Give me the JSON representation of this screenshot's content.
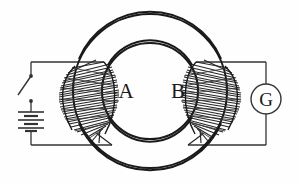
{
  "diagram": {
    "background_color": "#fefefe",
    "ink_color": "#1a1a1a",
    "coil_color": "#262626"
  },
  "labels": {
    "core_left": "A",
    "core_right": "B",
    "meter": "G"
  },
  "components": {
    "ring": {
      "name": "iron-ring-core",
      "center_x": 150,
      "center_y": 91,
      "outer_radius": 77,
      "inner_radius": 48
    },
    "primary_coil": {
      "name": "primary-winding-A",
      "side": "left",
      "turns": 30
    },
    "secondary_coil": {
      "name": "secondary-winding-B",
      "side": "right",
      "turns": 30
    },
    "switch": {
      "name": "open-switch",
      "state": "open",
      "x": 31,
      "y_top": 76,
      "y_bottom": 101
    },
    "battery": {
      "name": "battery-cells",
      "cells": 3,
      "x": 31,
      "y": 117
    },
    "galvanometer": {
      "name": "galvanometer",
      "center_x": 266,
      "center_y": 99,
      "radius": 15
    }
  },
  "wires": {
    "left_top_y": 62,
    "left_bottom_y": 145,
    "left_x": 31,
    "right_top_y": 62,
    "right_bottom_y": 145,
    "right_x": 266
  }
}
